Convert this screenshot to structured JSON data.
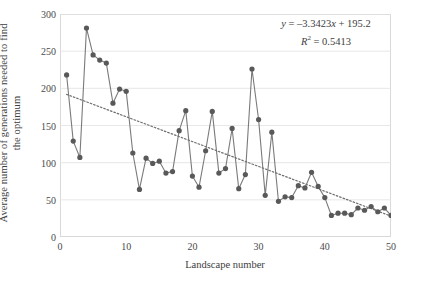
{
  "chart_data": {
    "type": "scatter",
    "title": "",
    "xlabel": "Landscape number",
    "ylabel_line1": "Average number of generations needed to find",
    "ylabel_line2": "the optimum",
    "xlim": [
      0,
      50
    ],
    "ylim": [
      0,
      300
    ],
    "xticks": [
      0,
      10,
      20,
      30,
      40,
      50
    ],
    "yticks": [
      0,
      50,
      100,
      150,
      200,
      250,
      300
    ],
    "grid": "horizontal",
    "legend": "none",
    "marker_color": "#595959",
    "line_color": "#7a7a7a",
    "trend_color": "#6e6e6e",
    "x": [
      1,
      2,
      3,
      4,
      5,
      6,
      7,
      8,
      9,
      10,
      11,
      12,
      13,
      14,
      15,
      16,
      17,
      18,
      19,
      20,
      21,
      22,
      23,
      24,
      25,
      26,
      27,
      28,
      29,
      30,
      31,
      32,
      33,
      34,
      35,
      36,
      37,
      38,
      39,
      40,
      41,
      42,
      43,
      44,
      45,
      46,
      47,
      48,
      49,
      50
    ],
    "values": [
      218,
      129,
      107,
      281,
      245,
      238,
      234,
      180,
      199,
      196,
      113,
      64,
      106,
      99,
      102,
      86,
      88,
      143,
      170,
      82,
      67,
      116,
      169,
      86,
      92,
      146,
      65,
      84,
      226,
      158,
      56,
      141,
      48,
      54,
      53,
      69,
      66,
      87,
      68,
      53,
      29,
      32,
      32,
      30,
      39,
      36,
      41,
      34,
      39,
      29
    ],
    "series": [
      {
        "name": "Average generations to optimum",
        "values": [
          218,
          129,
          107,
          281,
          245,
          238,
          234,
          180,
          199,
          196,
          113,
          64,
          106,
          99,
          102,
          86,
          88,
          143,
          170,
          82,
          67,
          116,
          169,
          86,
          92,
          146,
          65,
          84,
          226,
          158,
          56,
          141,
          48,
          54,
          53,
          69,
          66,
          87,
          68,
          53,
          29,
          32,
          32,
          30,
          39,
          36,
          41,
          34,
          39,
          29
        ]
      }
    ],
    "trendline": {
      "type": "linear",
      "slope": -3.3423,
      "intercept": 195.2,
      "r_squared": 0.5413,
      "style": "dotted",
      "equation_text": "y = –3.3423x + 195.2",
      "r2_text": "R² = 0.5413"
    }
  },
  "annotation": {
    "equation_prefix": "y",
    "equation_body": " = –3.3423",
    "equation_var": "x",
    "equation_suffix": " + 195.2",
    "r_symbol": "R",
    "r_exponent": "2",
    "r_value": " = 0.5413"
  },
  "axes": {
    "x_title": "Landscape number",
    "y_title_line1": "Average number of generations needed to find",
    "y_title_line2": "the optimum",
    "x_tick_labels": [
      "0",
      "10",
      "20",
      "30",
      "40",
      "50"
    ],
    "y_tick_labels": [
      "0",
      "50",
      "100",
      "150",
      "200",
      "250",
      "300"
    ]
  },
  "caption": {
    "sliver_text": ""
  }
}
